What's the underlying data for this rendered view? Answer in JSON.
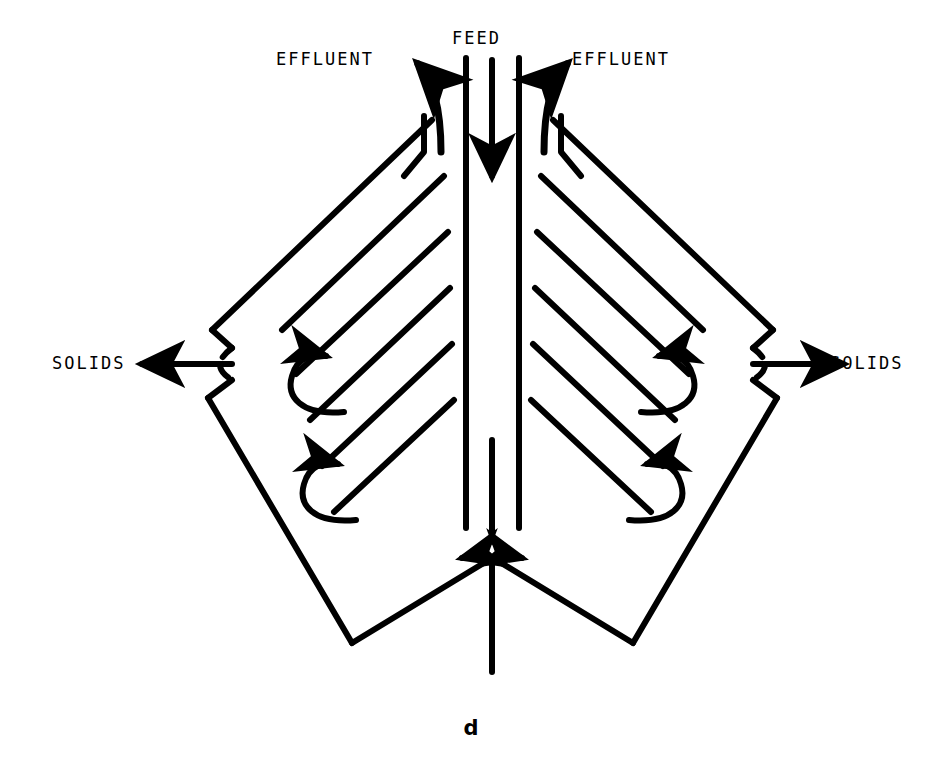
{
  "figure": {
    "panel_label": "d",
    "labels": {
      "feed": "FEED",
      "effluent_left": "EFFLUENT",
      "effluent_right": "EFFLUENT",
      "solids_left": "SOLIDS",
      "solids_right": "SOLIDS"
    },
    "colors": {
      "ink": "#000000",
      "background": "#ffffff"
    },
    "diagram_type": "process-flow-schematic",
    "elements": {
      "feed_channel": "central vertical duct with downward arrow",
      "baffles_per_side": 5,
      "recirculation_arrows_per_side": 2,
      "screen_arcs": 2,
      "effluent_outlets": 2,
      "solids_outlets": 2
    }
  }
}
